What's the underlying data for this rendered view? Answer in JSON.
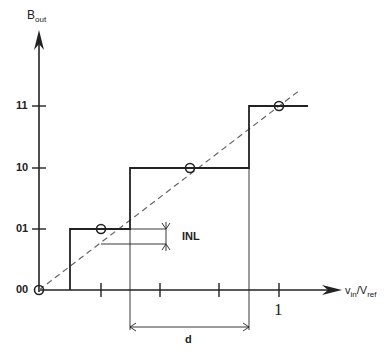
{
  "diagram": {
    "y_axis_label": "B",
    "y_axis_label_sub": "out",
    "x_axis_label_v": "v",
    "x_axis_label_v_sub": "in",
    "x_axis_label_sep": "/V",
    "x_axis_label_ref_sub": "ref",
    "y_levels": [
      "00",
      "01",
      "10",
      "11"
    ],
    "x_tick_label": "1",
    "annotations": {
      "inl": "INL",
      "d": "d"
    },
    "colors": {
      "line": "#222222",
      "dashed": "#666666"
    }
  }
}
